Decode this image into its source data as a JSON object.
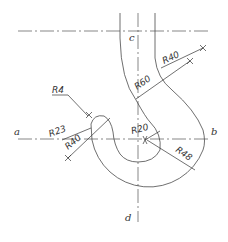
{
  "drawing": {
    "title": "Hook drawing with arc radii",
    "stroke_color": "#4a4a4a",
    "background": "#ffffff",
    "axis_labels": {
      "a": "a",
      "b": "b",
      "c": "c",
      "d": "d"
    },
    "dimensions": {
      "r4": "R4",
      "r23": "R23",
      "r40_left": "R40",
      "r40_top": "R40",
      "r60": "R60",
      "r20": "R20",
      "r48": "R48"
    }
  }
}
